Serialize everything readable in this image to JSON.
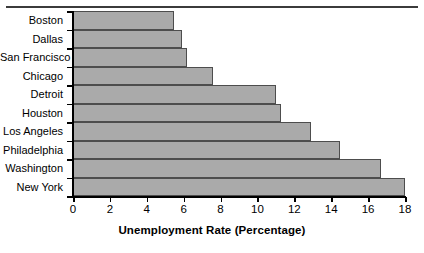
{
  "chart_data": {
    "type": "bar",
    "orientation": "horizontal",
    "title": "",
    "xlabel": "Unemployment Rate (Percentage)",
    "ylabel": "",
    "categories": [
      "Boston",
      "Dallas",
      "San Francisco",
      "Chicago",
      "Detroit",
      "Houston",
      "Los Angeles",
      "Philadelphia",
      "Washington",
      "New York"
    ],
    "values": [
      5.5,
      5.9,
      6.2,
      7.6,
      11.0,
      11.3,
      12.9,
      14.5,
      16.7,
      18.0
    ],
    "xlim": [
      0,
      18
    ],
    "xticks": [
      0,
      2,
      4,
      6,
      8,
      10,
      12,
      14,
      16,
      18
    ],
    "xtick_labels": [
      "0",
      "2",
      "4",
      "6",
      "8",
      "10",
      "12",
      "14",
      "16",
      "18"
    ],
    "grid": false,
    "legend": null,
    "bar_color": "#aaaaaa",
    "bar_edge_color": "#4d4d4d",
    "axis_color": "#000000"
  }
}
